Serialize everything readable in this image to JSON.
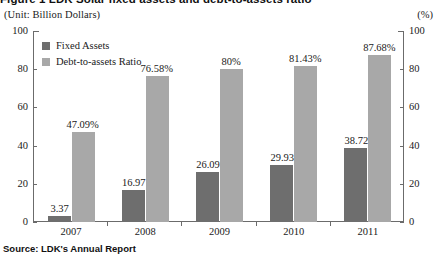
{
  "figure": {
    "title": "Figure 1  LDK Solar fixed assets and debt-to-assets ratio",
    "unit_left": "(Unit: Billion Dollars)",
    "unit_right": "(%)",
    "source": "Source: LDK's Annual Report"
  },
  "legend": {
    "items": [
      {
        "label": "Fixed Assets",
        "color": "#6e6e6e"
      },
      {
        "label": "Debt-to-assets Ratio",
        "color": "#a8a8a8"
      }
    ]
  },
  "axes": {
    "left_ticks": [
      "100",
      "80",
      "60",
      "40",
      "20",
      "0"
    ],
    "right_ticks": [
      "100",
      "80",
      "60",
      "40",
      "20",
      "0"
    ]
  },
  "chart_data": {
    "type": "bar",
    "title": "Figure 1  LDK Solar fixed assets and debt-to-assets ratio",
    "xlabel": "",
    "ylabel": "(Unit: Billion Dollars)",
    "y2label": "(%)",
    "ylim": [
      0,
      100
    ],
    "y2lim": [
      0,
      100
    ],
    "yticks": [
      0,
      20,
      40,
      60,
      80,
      100
    ],
    "grid": false,
    "legend_position": "top-left",
    "categories": [
      "2007",
      "2008",
      "2009",
      "2010",
      "2011"
    ],
    "series": [
      {
        "name": "Fixed Assets",
        "color": "#6e6e6e",
        "axis": "left",
        "values": [
          3.37,
          16.97,
          26.09,
          29.93,
          38.72
        ],
        "labels": [
          "3.37",
          "16.97",
          "26.09",
          "29.93",
          "38.72"
        ]
      },
      {
        "name": "Debt-to-assets Ratio",
        "color": "#a8a8a8",
        "axis": "right",
        "values": [
          47.09,
          76.58,
          80,
          81.43,
          87.68
        ],
        "labels": [
          "47.09%",
          "76.58%",
          "80%",
          "81.43%",
          "87.68%"
        ]
      }
    ]
  }
}
